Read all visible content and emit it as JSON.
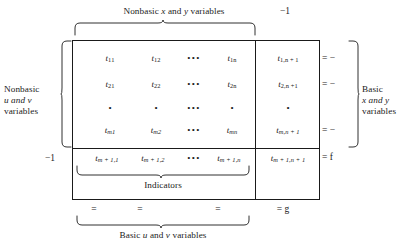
{
  "figure": {
    "type": "simplex-tableau-diagram",
    "top_label": "Nonbasic x and y variables",
    "top_right_label": "−1",
    "left_label_line1": "Nonbasic",
    "left_label_line2": "u and v",
    "left_label_line3": "variables",
    "right_label_line1": "Basic",
    "right_label_line2": "x and y",
    "right_label_line3": "variables",
    "indicators_label": "Indicators",
    "bottom_label": "Basic u and v variables",
    "indicator_row_left_label": "−1"
  },
  "matrix": {
    "rows": [
      {
        "id": "row-1",
        "cells": [
          "t",
          "t",
          "dots",
          "t"
        ],
        "subs": [
          "11",
          "12",
          "",
          "1n"
        ],
        "aug_cell": "t",
        "aug_sub": "1,n + 1",
        "equation": "= −"
      },
      {
        "id": "row-2",
        "cells": [
          "t",
          "t",
          "dots",
          "t"
        ],
        "subs": [
          "21",
          "22",
          "",
          "2n"
        ],
        "aug_cell": "t",
        "aug_sub": "2,n +1",
        "equation": "= −"
      },
      {
        "id": "row-dots",
        "cells": [
          "•",
          "•",
          "dots",
          "•"
        ],
        "subs": [
          "",
          "",
          "",
          ""
        ],
        "aug_cell": "•",
        "aug_sub": "",
        "equation": ""
      },
      {
        "id": "row-m",
        "cells": [
          "t",
          "t",
          "dots",
          "t"
        ],
        "subs": [
          "m1",
          "m2",
          "",
          "mn"
        ],
        "aug_cell": "t",
        "aug_sub": "m,n + 1",
        "equation": "= −"
      }
    ],
    "indicator_row": {
      "id": "row-m-plus-1",
      "cells": [
        "t",
        "t",
        "dots",
        "t"
      ],
      "subs": [
        "m + 1,1",
        "m + 1,2",
        "",
        "m + 1,n"
      ],
      "aug_cell": "t",
      "aug_sub": "m + 1,n + 1",
      "equation": "= f"
    },
    "bottom_row": {
      "eq1": "=",
      "eq2": "=",
      "eq3": "=",
      "aug_eq": "= g"
    },
    "ellipsis": "•••"
  },
  "colors": {
    "ink": "#1a1a1a",
    "background": "#ffffff"
  }
}
